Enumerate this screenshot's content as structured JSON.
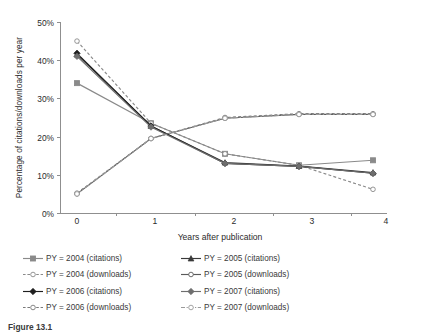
{
  "chart_data": {
    "type": "line",
    "title": "",
    "xlabel": "Years after publication",
    "ylabel": "Percentage of citations/downloads per year",
    "x": [
      0,
      1,
      2,
      3,
      4
    ],
    "xtick_labels": [
      "0",
      "1",
      "2",
      "3",
      "4"
    ],
    "ytick_labels": [
      "0%",
      "10%",
      "20%",
      "30%",
      "40%",
      "50%"
    ],
    "ytick_values": [
      0,
      10,
      20,
      30,
      40,
      50
    ],
    "ylim": [
      0,
      50
    ],
    "xlim": [
      0,
      4
    ],
    "grid": false,
    "legend_position": "bottom",
    "units": "percent",
    "series": [
      {
        "name": "PY = 2004 (citations)",
        "marker": "filled-square",
        "color": "#8a8a8a",
        "dash": "solid",
        "values": [
          34.0,
          23.5,
          15.5,
          12.5,
          13.8
        ]
      },
      {
        "name": "PY = 2004 (downloads)",
        "marker": "open-circle",
        "color": "#8a8a8a",
        "dash": "dashed",
        "values": [
          45.0,
          23.5,
          15.5,
          12.5,
          6.2
        ]
      },
      {
        "name": "PY = 2005 (citations)",
        "marker": "filled-triangle",
        "color": "#3a3a3a",
        "dash": "solid",
        "values": [
          41.5,
          22.8,
          13.2,
          12.3,
          10.6
        ]
      },
      {
        "name": "PY = 2005 (downloads)",
        "marker": "open-circle-dark",
        "color": "#5a5a5a",
        "dash": "solid",
        "values": [
          5.0,
          19.5,
          24.8,
          25.8,
          25.8
        ]
      },
      {
        "name": "PY = 2006 (citations)",
        "marker": "filled-diamond",
        "color": "#1f1f1f",
        "dash": "solid",
        "values": [
          41.8,
          22.8,
          13.0,
          12.2,
          10.4
        ]
      },
      {
        "name": "PY = 2006 (downloads)",
        "marker": "open-circle",
        "color": "#7a7a7a",
        "dash": "dashed",
        "values": [
          5.2,
          19.5,
          25.0,
          26.0,
          26.0
        ]
      },
      {
        "name": "PY = 2007 (citations)",
        "marker": "filled-diamond-gray",
        "color": "#6e6e6e",
        "dash": "solid",
        "values": [
          41.0,
          22.5,
          13.0,
          12.2,
          10.4
        ]
      },
      {
        "name": "PY = 2007 (downloads)",
        "marker": "open-circle",
        "color": "#9a9a9a",
        "dash": "dash-dot",
        "values": [
          5.0,
          19.5,
          24.8,
          25.8,
          25.8
        ]
      }
    ]
  },
  "legend": {
    "items": [
      {
        "label": "PY = 2004 (citations)",
        "symbol": "filled-square-gray"
      },
      {
        "label": "PY = 2004 (downloads)",
        "symbol": "open-circle-dashed"
      },
      {
        "label": "PY = 2006 (citations)",
        "symbol": "filled-diamond-black"
      },
      {
        "label": "PY = 2006 (downloads)",
        "symbol": "open-circle-dashed"
      },
      {
        "label": "PY = 2005 (citations)",
        "symbol": "filled-triangle-black"
      },
      {
        "label": "PY = 2005 (downloads)",
        "symbol": "open-circle-dark"
      },
      {
        "label": "PY = 2007 (citations)",
        "symbol": "filled-diamond-gray"
      },
      {
        "label": "PY = 2007 (downloads)",
        "symbol": "open-circle-dashdot"
      }
    ]
  },
  "caption": {
    "label": "Figure 13.1"
  }
}
